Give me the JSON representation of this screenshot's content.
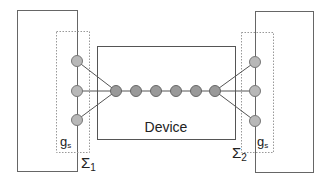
{
  "diagram": {
    "device_label": "Device",
    "left_region": {
      "label_main": "Σ",
      "label_sub": "1",
      "group_main": "g",
      "group_sub": "s"
    },
    "right_region": {
      "label_main": "Σ",
      "label_sub": "2",
      "group_main": "g",
      "group_sub": "s"
    },
    "colors": {
      "line": "#555555",
      "node_fill": "#b8b8b8",
      "node_stroke": "#777777",
      "chain_fill": "#999999",
      "dotted": "#999999"
    }
  }
}
